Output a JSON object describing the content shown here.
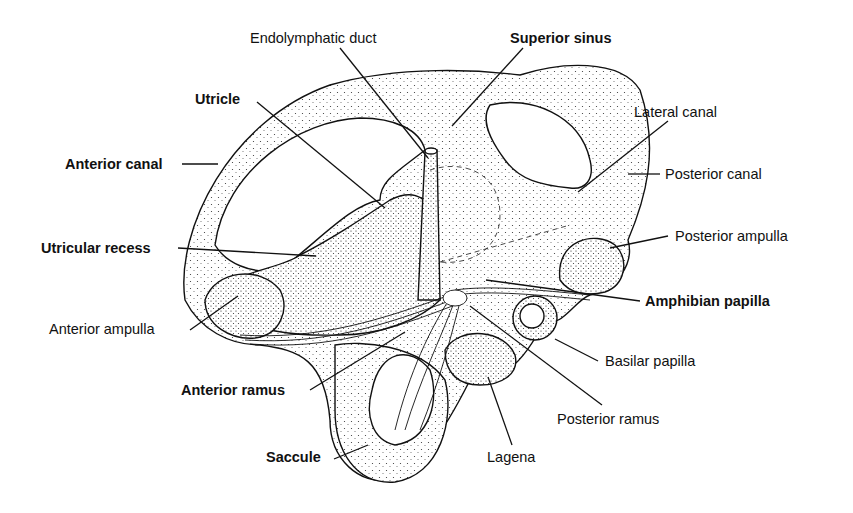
{
  "diagram": {
    "ink_color": "#111111",
    "background_color": "#ffffff",
    "labels": {
      "endolymphatic_duct": "Endolymphatic duct",
      "superior_sinus": "Superior sinus",
      "utricle": "Utricle",
      "lateral_canal": "Lateral canal",
      "anterior_canal": "Anterior canal",
      "posterior_canal": "Posterior canal",
      "utricular_recess": "Utricular recess",
      "posterior_ampulla": "Posterior ampulla",
      "amphibian_papilla": "Amphibian papilla",
      "anterior_ampulla": "Anterior ampulla",
      "basilar_papilla": "Basilar papilla",
      "anterior_ramus": "Anterior ramus",
      "posterior_ramus": "Posterior ramus",
      "saccule": "Saccule",
      "lagena": "Lagena"
    }
  }
}
